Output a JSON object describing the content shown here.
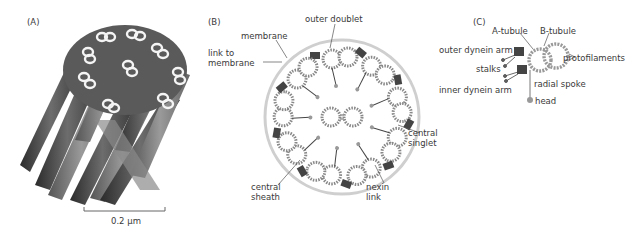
{
  "panels": {
    "a": {
      "label": "(A)",
      "scale_bar": "0.2 µm"
    },
    "b": {
      "label": "(B)",
      "labels": {
        "outer_doublet": "outer doublet",
        "membrane": "membrane",
        "link_to_membrane_1": "link to",
        "link_to_membrane_2": "membrane",
        "central_singlet_1": "central",
        "central_singlet_2": "singlet",
        "central_sheath_1": "central",
        "central_sheath_2": "sheath",
        "nexin_link_1": "nexin",
        "nexin_link_2": "link"
      }
    },
    "c": {
      "label": "(C)",
      "labels": {
        "a_tubule": "A-tubule",
        "b_tubule": "B-tubule",
        "outer_dynein_arm": "outer dynein arm",
        "protofilaments": "protofilaments",
        "stalks": "stalks",
        "inner_dynein_arm": "inner dynein arm",
        "radial_spoke": "radial spoke",
        "head": "head"
      }
    }
  },
  "colors": {
    "membrane": "#c8c8c8",
    "dark": "#3a3a3a",
    "bead": "#9a9a9a"
  }
}
